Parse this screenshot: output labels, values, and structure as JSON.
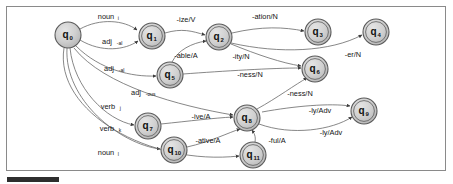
{
  "figure": {
    "type": "finite-state-transducer-diagram",
    "title": "",
    "caption_bar_color": "#2e2e2e",
    "frame_border_color": "#8a8a8a",
    "background": "#ffffff",
    "node_fill": "#cfcfcf",
    "node_stroke": "#5a5a5a",
    "edge_stroke": "#5f5f5f"
  },
  "nodes": [
    {
      "id": "q0",
      "label": "q",
      "sub": "0",
      "cx": 68,
      "cy": 35,
      "r": 13,
      "accepting": false
    },
    {
      "id": "q1",
      "label": "q",
      "sub": "1",
      "cx": 152,
      "cy": 36,
      "r": 13,
      "accepting": true
    },
    {
      "id": "q2",
      "label": "q",
      "sub": "2",
      "cx": 219,
      "cy": 37,
      "r": 13,
      "accepting": true
    },
    {
      "id": "q3",
      "label": "q",
      "sub": "3",
      "cx": 318,
      "cy": 32,
      "r": 13,
      "accepting": true
    },
    {
      "id": "q4",
      "label": "q",
      "sub": "4",
      "cx": 376,
      "cy": 32,
      "r": 13,
      "accepting": true
    },
    {
      "id": "q5",
      "label": "q",
      "sub": "5",
      "cx": 170,
      "cy": 75,
      "r": 13,
      "accepting": true
    },
    {
      "id": "q6",
      "label": "q",
      "sub": "6",
      "cx": 315,
      "cy": 69,
      "r": 13,
      "accepting": true
    },
    {
      "id": "q7",
      "label": "q",
      "sub": "7",
      "cx": 148,
      "cy": 126,
      "r": 13,
      "accepting": true
    },
    {
      "id": "q8",
      "label": "q",
      "sub": "8",
      "cx": 247,
      "cy": 118,
      "r": 13,
      "accepting": true
    },
    {
      "id": "q9",
      "label": "q",
      "sub": "9",
      "cx": 364,
      "cy": 111,
      "r": 13,
      "accepting": true
    },
    {
      "id": "q10",
      "label": "q",
      "sub": "10",
      "cx": 174,
      "cy": 150,
      "r": 13,
      "accepting": true
    },
    {
      "id": "q11",
      "label": "q",
      "sub": "11",
      "cx": 253,
      "cy": 155,
      "r": 13,
      "accepting": true
    }
  ],
  "edges": [
    {
      "id": "e-q0-q1-noun",
      "from": "q0",
      "to": "q1",
      "label": "noun",
      "sub": "i",
      "lx": 110,
      "ly": 17
    },
    {
      "id": "e-q0-q1-adj",
      "from": "q0",
      "to": "q1",
      "label": "adj",
      "sub": "-al",
      "lx": 111,
      "ly": 42
    },
    {
      "id": "e-q1-q2",
      "from": "q1",
      "to": "q2",
      "label": "-ize/V",
      "sub": "",
      "lx": 186,
      "ly": 20
    },
    {
      "id": "e-q2-q3",
      "from": "q2",
      "to": "q3",
      "label": "-ation/N",
      "sub": "",
      "lx": 265,
      "ly": 17
    },
    {
      "id": "e-q3-q4",
      "from": "q3",
      "to": "q4",
      "label": "-er/N",
      "sub": "",
      "lx": 353,
      "ly": 55
    },
    {
      "id": "e-q0-q5-adj",
      "from": "q0",
      "to": "q5",
      "label": "adj",
      "sub": "-al",
      "lx": 113,
      "ly": 69
    },
    {
      "id": "e-q5-q2",
      "from": "q5",
      "to": "q2",
      "label": "-able/A",
      "sub": "",
      "lx": 186,
      "ly": 56
    },
    {
      "id": "e-q2-q6",
      "from": "q2",
      "to": "q6",
      "label": "-ity/N",
      "sub": "",
      "lx": 241,
      "ly": 57
    },
    {
      "id": "e-q5-q6",
      "from": "q5",
      "to": "q6",
      "label": "-ness/N",
      "sub": "",
      "lx": 250,
      "ly": 75
    },
    {
      "id": "e-q8-q6",
      "from": "q8",
      "to": "q6",
      "label": "-ness/N",
      "sub": "",
      "lx": 300,
      "ly": 94
    },
    {
      "id": "e-q0-q8-adj",
      "from": "q0",
      "to": "q8",
      "label": "adj",
      "sub": "-ous",
      "lx": 140,
      "ly": 93
    },
    {
      "id": "e-q0-q7-verb",
      "from": "q0",
      "to": "q7",
      "label": "verb",
      "sub": "j",
      "lx": 112,
      "ly": 107
    },
    {
      "id": "e-q0-q10-verb",
      "from": "q0",
      "to": "q10",
      "label": "verb",
      "sub": "k",
      "lx": 111,
      "ly": 129
    },
    {
      "id": "e-q0-q11-noun",
      "from": "q0",
      "to": "q11",
      "label": "noun",
      "sub": "l",
      "lx": 110,
      "ly": 153
    },
    {
      "id": "e-q7-q8",
      "from": "q7",
      "to": "q8",
      "label": "-ive/A",
      "sub": "",
      "lx": 201,
      "ly": 117
    },
    {
      "id": "e-q10-q8",
      "from": "q10",
      "to": "q8",
      "label": "-ative/A",
      "sub": "",
      "lx": 208,
      "ly": 141
    },
    {
      "id": "e-q11-q8",
      "from": "q11",
      "to": "q8",
      "label": "-ful/A",
      "sub": "",
      "lx": 277,
      "ly": 141
    },
    {
      "id": "e-q6-q9",
      "from": "q6",
      "to": "q9",
      "label": "-ly/Adv",
      "sub": "",
      "lx": 320,
      "ly": 111
    },
    {
      "id": "e-q8-q9",
      "from": "q8",
      "to": "q9",
      "label": "-ly/Adv",
      "sub": "",
      "lx": 331,
      "ly": 133
    }
  ],
  "caption": {
    "bar_label": "",
    "text": ""
  }
}
